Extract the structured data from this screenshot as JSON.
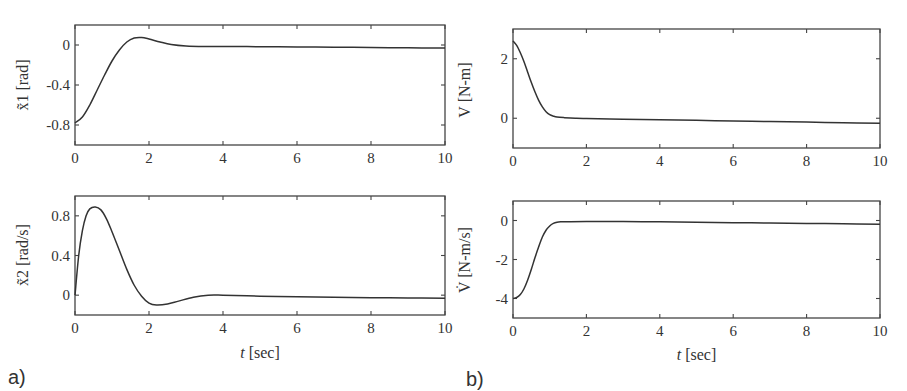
{
  "figure": {
    "panel_labels": [
      "a)",
      "b)"
    ],
    "xlabel": "t [sec]",
    "xticks": [
      "0",
      "2",
      "4",
      "6",
      "8",
      "10"
    ]
  },
  "chart_data": [
    {
      "type": "line",
      "panel": "a-top",
      "title": "",
      "xlabel": "",
      "ylabel": "x̃1 [rad]",
      "xlim": [
        0,
        10
      ],
      "ylim": [
        -1.0,
        0.2
      ],
      "xticks": [
        0,
        2,
        4,
        6,
        8,
        10
      ],
      "yticks": [
        0,
        -0.4,
        -0.8
      ],
      "ytick_labels": [
        "0",
        "-0.4",
        "-0.8"
      ],
      "grid": false,
      "series": [
        {
          "name": "x1_tilde",
          "x": [
            0,
            0.2,
            0.4,
            0.6,
            0.8,
            1.0,
            1.2,
            1.4,
            1.6,
            1.8,
            2.0,
            2.3,
            2.6,
            3.0,
            3.5,
            4,
            5,
            6,
            7,
            8,
            9,
            10
          ],
          "y": [
            -0.78,
            -0.72,
            -0.6,
            -0.45,
            -0.3,
            -0.16,
            -0.05,
            0.03,
            0.07,
            0.075,
            0.06,
            0.03,
            0.005,
            -0.01,
            -0.015,
            -0.015,
            -0.017,
            -0.02,
            -0.022,
            -0.025,
            -0.028,
            -0.03
          ]
        }
      ]
    },
    {
      "type": "line",
      "panel": "a-bottom",
      "title": "",
      "xlabel": "t [sec]",
      "ylabel": "x̃2 [rad/s]",
      "xlim": [
        0,
        10
      ],
      "ylim": [
        -0.2,
        1.0
      ],
      "xticks": [
        0,
        2,
        4,
        6,
        8,
        10
      ],
      "yticks": [
        0.8,
        0.4,
        0
      ],
      "ytick_labels": [
        "0.8",
        "0.4",
        "0"
      ],
      "grid": false,
      "series": [
        {
          "name": "x2_tilde",
          "x": [
            0,
            0.1,
            0.2,
            0.3,
            0.4,
            0.55,
            0.7,
            0.85,
            1.0,
            1.2,
            1.4,
            1.6,
            1.8,
            2.0,
            2.2,
            2.5,
            2.8,
            3.2,
            3.6,
            4.0,
            5,
            6,
            7,
            8,
            9,
            10
          ],
          "y": [
            0.0,
            0.4,
            0.65,
            0.8,
            0.87,
            0.89,
            0.86,
            0.77,
            0.64,
            0.45,
            0.26,
            0.1,
            -0.01,
            -0.08,
            -0.1,
            -0.09,
            -0.06,
            -0.02,
            0.0,
            0.0,
            -0.01,
            -0.015,
            -0.02,
            -0.025,
            -0.028,
            -0.03
          ]
        }
      ]
    },
    {
      "type": "line",
      "panel": "b-top",
      "title": "",
      "xlabel": "",
      "ylabel": "V [N-m]",
      "xlim": [
        0,
        10
      ],
      "ylim": [
        -1,
        3
      ],
      "xticks": [
        0,
        2,
        4,
        6,
        8,
        10
      ],
      "yticks": [
        2,
        0
      ],
      "ytick_labels": [
        "2",
        "0"
      ],
      "grid": false,
      "series": [
        {
          "name": "V",
          "x": [
            0,
            0.1,
            0.2,
            0.3,
            0.4,
            0.5,
            0.6,
            0.7,
            0.8,
            0.9,
            1.0,
            1.1,
            1.2,
            1.4,
            1.7,
            2.0,
            3,
            4,
            5,
            6,
            7,
            8,
            9,
            10
          ],
          "y": [
            2.6,
            2.45,
            2.2,
            1.9,
            1.55,
            1.2,
            0.88,
            0.6,
            0.38,
            0.22,
            0.12,
            0.07,
            0.04,
            0.02,
            0.0,
            -0.01,
            -0.03,
            -0.05,
            -0.07,
            -0.09,
            -0.11,
            -0.13,
            -0.15,
            -0.17
          ]
        }
      ]
    },
    {
      "type": "line",
      "panel": "b-bottom",
      "title": "",
      "xlabel": "t [sec]",
      "ylabel": "V̇ [N-m/s]",
      "xlim": [
        0,
        10
      ],
      "ylim": [
        -5,
        1
      ],
      "xticks": [
        0,
        2,
        4,
        6,
        8,
        10
      ],
      "yticks": [
        0,
        -2,
        -4
      ],
      "ytick_labels": [
        "0",
        "-2",
        "-4"
      ],
      "grid": false,
      "series": [
        {
          "name": "V_dot",
          "x": [
            0,
            0.1,
            0.2,
            0.3,
            0.4,
            0.5,
            0.6,
            0.7,
            0.8,
            0.9,
            1.0,
            1.1,
            1.2,
            1.3,
            1.5,
            2.0,
            3,
            4,
            5,
            6,
            7,
            8,
            9,
            10
          ],
          "y": [
            -4.0,
            -3.95,
            -3.8,
            -3.5,
            -3.05,
            -2.5,
            -1.9,
            -1.35,
            -0.85,
            -0.5,
            -0.28,
            -0.15,
            -0.09,
            -0.07,
            -0.06,
            -0.05,
            -0.05,
            -0.07,
            -0.09,
            -0.11,
            -0.13,
            -0.15,
            -0.17,
            -0.19
          ]
        }
      ]
    }
  ]
}
